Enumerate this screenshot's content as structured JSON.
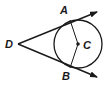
{
  "diagram": {
    "points": {
      "A": {
        "label": "A",
        "x": 70,
        "y": 19
      },
      "B": {
        "label": "B",
        "x": 70,
        "y": 68
      },
      "C": {
        "label": "C",
        "x": 78,
        "y": 44
      },
      "D": {
        "label": "D",
        "x": 18,
        "y": 44
      }
    },
    "circle": {
      "center": "C",
      "radius": 24
    },
    "rays": [
      {
        "from": "D",
        "through": "A"
      },
      {
        "from": "D",
        "through": "B"
      }
    ],
    "segments": [
      {
        "from": "A",
        "to": "C"
      },
      {
        "from": "B",
        "to": "C"
      }
    ],
    "stroke_color": "#1a1a1a"
  }
}
